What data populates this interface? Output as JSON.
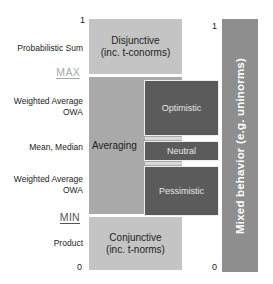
{
  "diagram": {
    "type": "aggregation-operator-spectrum",
    "left_axis": {
      "top_tick": "1",
      "bottom_tick": "0",
      "labels": [
        {
          "id": "probabilistic-sum",
          "text": "Probabilistic Sum"
        },
        {
          "id": "max",
          "text": "MAX"
        },
        {
          "id": "weighted-average-owa-upper",
          "line1": "Weighted Average",
          "line2": "OWA"
        },
        {
          "id": "mean-median",
          "text": "Mean, Median"
        },
        {
          "id": "weighted-average-owa-lower",
          "line1": "Weighted Average",
          "line2": "OWA"
        },
        {
          "id": "min",
          "text": "MIN"
        },
        {
          "id": "product",
          "text": "Product"
        }
      ]
    },
    "boxes": {
      "disjunctive": {
        "line1": "Disjunctive",
        "line2": "(inc. t-conorms)"
      },
      "averaging": {
        "label": "Averaging"
      },
      "optimistic": {
        "label": "Optimistic"
      },
      "neutral": {
        "label": "Neutral"
      },
      "pessimistic": {
        "label": "Pessimistic"
      },
      "conjunctive": {
        "line1": "Conjunctive",
        "line2": "(inc. t-norms)"
      }
    },
    "right_axis": {
      "top_tick": "1",
      "bottom_tick": "0",
      "mixed_label": "Mixed behavior (e.g. uninorms)"
    },
    "colors": {
      "light_box": "#c4c4c4",
      "averaging_box": "#a9a9a9",
      "dark_box": "#5b5b5b",
      "mixed_bar": "#8e8e8e",
      "max_label": "#a8a8a8",
      "min_label": "#555555"
    }
  }
}
